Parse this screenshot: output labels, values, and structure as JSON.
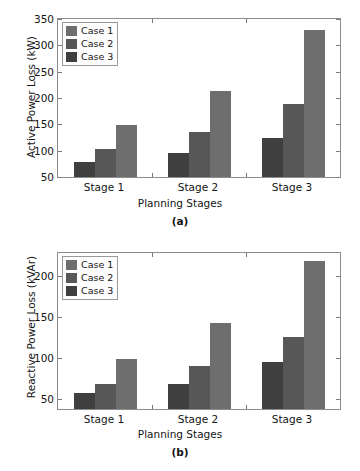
{
  "colors": {
    "case1": "#6e6e6e",
    "case2": "#575757",
    "case3": "#3f3f3f",
    "axis": "#8d8d8d",
    "text": "#141414",
    "background": "#ffffff"
  },
  "legend": {
    "entries": [
      {
        "label": "Case 1",
        "color": "#6e6e6e"
      },
      {
        "label": "Case 2",
        "color": "#575757"
      },
      {
        "label": "Case 3",
        "color": "#3f3f3f"
      }
    ]
  },
  "panels": [
    {
      "tag": "(a)"
    },
    {
      "tag": "(b)"
    }
  ],
  "chart_data": [
    {
      "type": "bar",
      "panel": "(a)",
      "title": "",
      "xlabel": "Planning Stages",
      "ylabel": "Active Power Loss (kW)",
      "categories": [
        "Stage 1",
        "Stage 2",
        "Stage 3"
      ],
      "ylim": [
        50,
        350
      ],
      "yticks": [
        50,
        100,
        150,
        200,
        250,
        300,
        350
      ],
      "ytick_labels": [
        "50",
        "100",
        "150",
        "200",
        "250",
        "300",
        "350"
      ],
      "grid": false,
      "legend_position": "upper-left",
      "bar_order": [
        "Case 3",
        "Case 2",
        "Case 1"
      ],
      "series": [
        {
          "name": "Case 3",
          "color": "#3f3f3f",
          "values": [
            78,
            95,
            125
          ]
        },
        {
          "name": "Case 2",
          "color": "#575757",
          "values": [
            103,
            136,
            189
          ]
        },
        {
          "name": "Case 1",
          "color": "#6e6e6e",
          "values": [
            148,
            214,
            330
          ]
        }
      ]
    },
    {
      "type": "bar",
      "panel": "(b)",
      "title": "",
      "xlabel": "Planning Stages",
      "ylabel": "Reactive Power Loss (kVAr)",
      "categories": [
        "Stage 1",
        "Stage 2",
        "Stage 3"
      ],
      "ylim": [
        38,
        228
      ],
      "yticks": [
        50,
        100,
        150,
        200
      ],
      "ytick_labels": [
        "50",
        "100",
        "150",
        "200"
      ],
      "grid": false,
      "legend_position": "upper-left",
      "bar_order": [
        "Case 3",
        "Case 2",
        "Case 1"
      ],
      "series": [
        {
          "name": "Case 3",
          "color": "#3f3f3f",
          "values": [
            58,
            69,
            95
          ]
        },
        {
          "name": "Case 2",
          "color": "#575757",
          "values": [
            68,
            90,
            126
          ]
        },
        {
          "name": "Case 1",
          "color": "#6e6e6e",
          "values": [
            99,
            143,
            218
          ]
        }
      ]
    }
  ]
}
